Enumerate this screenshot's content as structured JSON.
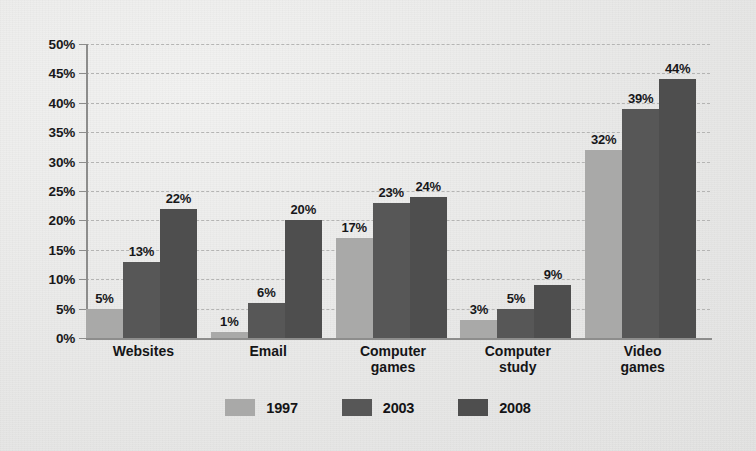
{
  "chart_data": {
    "type": "bar",
    "title": "",
    "subtitle": "",
    "xlabel": "",
    "ylabel": "",
    "ylim": [
      0,
      50
    ],
    "ytick_labels": [
      "0%",
      "5%",
      "10%",
      "15%",
      "20%",
      "25%",
      "30%",
      "35%",
      "40%",
      "45%",
      "50%"
    ],
    "ytick_values": [
      0,
      5,
      10,
      15,
      20,
      25,
      30,
      35,
      40,
      45,
      50
    ],
    "grid": true,
    "grid_axis": "y",
    "grid_style": "dashed",
    "legend_position": "bottom",
    "value_label_suffix": "%",
    "categories": [
      "Websites",
      "Email",
      "Computer games",
      "Computer study",
      "Video games"
    ],
    "series": [
      {
        "name": "1997",
        "color": "#a9a9a8",
        "values": [
          5,
          1,
          17,
          3,
          32
        ],
        "labels": [
          "5%",
          "1%",
          "17%",
          "3%",
          "32%"
        ]
      },
      {
        "name": "2003",
        "color": "#575757",
        "values": [
          13,
          6,
          23,
          5,
          39
        ],
        "labels": [
          "13%",
          "6%",
          "23%",
          "5%",
          "39%"
        ]
      },
      {
        "name": "2008",
        "color": "#4e4e4e",
        "values": [
          22,
          20,
          24,
          9,
          44
        ],
        "labels": [
          "22%",
          "20%",
          "24%",
          "9%",
          "44%"
        ]
      }
    ]
  },
  "colors": {
    "background": "#ececeb",
    "axis": "#8d8d8c",
    "gridline": "#b4b4b3",
    "text": "#17171a",
    "series_1997": "#a9a9a8",
    "series_2003": "#575757",
    "series_2008": "#4e4e4e"
  }
}
